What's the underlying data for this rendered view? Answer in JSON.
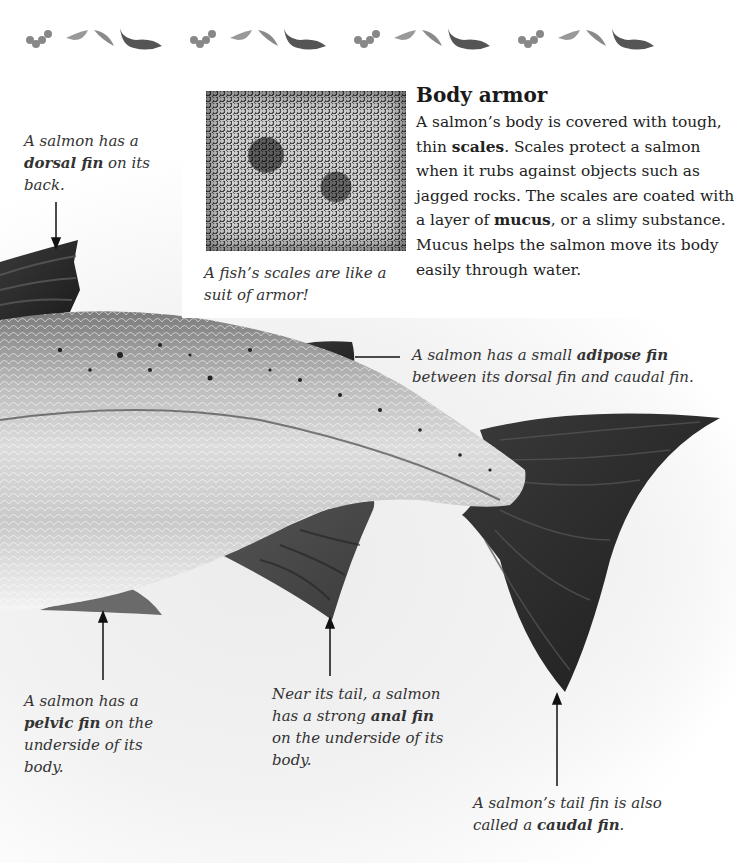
{
  "border_strip": {
    "icons": [
      "salmon-eggs-icon",
      "salmon-alevin-icon",
      "salmon-fry-icon",
      "adult-salmon-icon"
    ],
    "repeat": 4
  },
  "photo": {
    "icon": "fish-scales-photo",
    "caption": "A fish’s scales are like a suit of armor!"
  },
  "section": {
    "heading": "Body armor",
    "body": [
      {
        "text": "A salmon’s body is covered with tough, thin ",
        "bold": false
      },
      {
        "text": "scales",
        "bold": true
      },
      {
        "text": ". Scales protect a salmon when it rubs against objects such as jagged rocks. The scales are coated with a layer of ",
        "bold": false
      },
      {
        "text": "mucus",
        "bold": true
      },
      {
        "text": ", or a slimy substance. Mucus helps the salmon move its body easily through water.",
        "bold": false
      }
    ]
  },
  "callouts": {
    "dorsal": {
      "before": "A salmon has a ",
      "term": "dorsal fin",
      "after": " on its back."
    },
    "adipose": {
      "before": "A salmon has a small ",
      "term": "adipose fin",
      "after": " between its dorsal fin and caudal fin."
    },
    "pelvic": {
      "before": "A salmon has a ",
      "term": "pelvic fin",
      "after": " on the underside of its body."
    },
    "anal": {
      "before": "Near its tail, a salmon has a strong ",
      "term": "anal fin",
      "after": " on the underside of its body."
    },
    "caudal": {
      "before": "A salmon’s tail fin is also called a ",
      "term": "caudal fin",
      "after": "."
    }
  },
  "colors": {
    "fin_dark": "#2b2b2b",
    "body_light": "#e6e6e6",
    "body_mid": "#9a9a9a",
    "text": "#222222"
  }
}
